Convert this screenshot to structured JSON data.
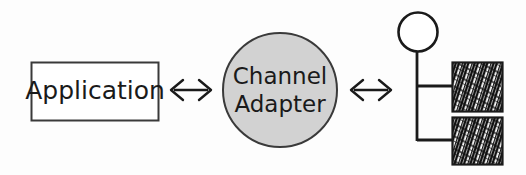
{
  "diagram": {
    "title": "Channel Adapter",
    "type": "enterprise-integration-pattern",
    "background_color": "#fdfdfd",
    "stroke_color": "#1a1a1a",
    "nodes": [
      {
        "id": "application",
        "shape": "rectangle",
        "label": "Application",
        "fill_color": "#ffffff",
        "stroke_color": "#3a3a3a",
        "x": 31,
        "y": 62,
        "width": 127,
        "height": 58
      },
      {
        "id": "channel-adapter",
        "shape": "circle",
        "label_line1": "Channel",
        "label_line2": "Adapter",
        "fill_color": "#d2d2d2",
        "stroke_color": "#3a3a3a",
        "cx": 280,
        "cy": 90,
        "r": 58
      },
      {
        "id": "messaging-system",
        "shape": "bus-topology",
        "label": "Messaging System",
        "node_circle": {
          "cx": 418,
          "cy": 32,
          "r": 20,
          "fill_color": "#ffffff"
        },
        "bus_x": 417,
        "bus_top": 52,
        "bus_bottom": 140,
        "branches": [
          85,
          140
        ],
        "endpoints": [
          {
            "id": "endpoint-top",
            "x": 452,
            "y": 62,
            "width": 51,
            "height": 50,
            "fill": "scribble"
          },
          {
            "id": "endpoint-bottom",
            "x": 452,
            "y": 117,
            "width": 51,
            "height": 48,
            "fill": "scribble"
          }
        ]
      }
    ],
    "connectors": [
      {
        "id": "application-to-adapter",
        "type": "double-headed-arrow",
        "glyph": "arrows-left-right-icon",
        "from": "application",
        "to": "channel-adapter",
        "x1": 168,
        "x2": 214,
        "y": 90
      },
      {
        "id": "adapter-to-messaging-system",
        "type": "double-headed-arrow",
        "glyph": "arrows-left-right-icon",
        "from": "channel-adapter",
        "to": "messaging-system",
        "x1": 348,
        "x2": 394,
        "y": 90
      }
    ]
  }
}
